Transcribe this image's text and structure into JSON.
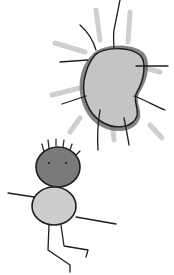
{
  "image": {
    "kind": "child-drawing",
    "description": "Hand-drawn grayscale sketch of a kidney-shaped sun with rays and a stick figure child below",
    "width": 174,
    "height": 275
  },
  "colors": {
    "background": "#ffffff",
    "line": "#1e1e1e",
    "sun_fill": "#c4c4c4",
    "sun_halo": "#6e6e6e",
    "ray_soft": "#cfcfcf",
    "head_fill": "#7a7a7a",
    "body_fill": "#cdcdcd"
  },
  "elements": {
    "sun": {
      "label": "sun"
    },
    "figure": {
      "label": "stick-figure"
    }
  }
}
